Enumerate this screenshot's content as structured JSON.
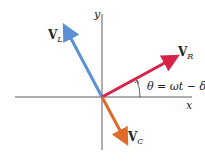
{
  "diagram": {
    "axes": {
      "x_label": "x",
      "y_label": "y"
    },
    "vectors": [
      {
        "name": "V_L",
        "base": "V",
        "sub": "L",
        "color": "#5b8fd6"
      },
      {
        "name": "V_R",
        "base": "V",
        "sub": "R",
        "color": "#d8224a"
      },
      {
        "name": "V_C",
        "base": "V",
        "sub": "C",
        "color": "#e06a28"
      }
    ],
    "angle_label": "θ = ωt − δ"
  }
}
